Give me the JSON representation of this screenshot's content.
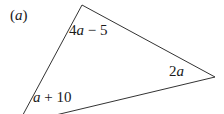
{
  "figure": {
    "part_label": "(a)",
    "shape": "triangle",
    "stroke_color": "#333333",
    "background_color": "#ffffff",
    "stroke_width": 1,
    "vertices": [
      {
        "name": "apex",
        "x": 82,
        "y": 5
      },
      {
        "name": "right",
        "x": 215,
        "y": 77
      },
      {
        "name": "bottom-left",
        "x": 18,
        "y": 124
      }
    ],
    "sides": [
      {
        "name": "upper-left-side",
        "label": "4a − 5",
        "from": "apex",
        "to": "bottom-left"
      },
      {
        "name": "right-side",
        "label": "2a",
        "from": "apex",
        "to": "right"
      },
      {
        "name": "bottom-side",
        "label": "a + 10",
        "from": "bottom-left",
        "to": "right"
      }
    ],
    "labels": {
      "top": "4a − 5",
      "right": "2a",
      "bottom": "a + 10"
    }
  }
}
